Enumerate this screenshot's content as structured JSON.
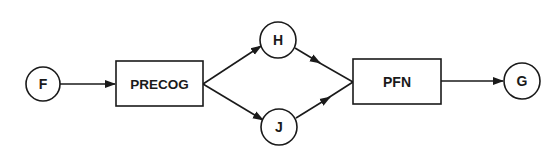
{
  "diagram": {
    "colors": {
      "stroke": "#1a1a1a",
      "background": "#ffffff"
    },
    "nodes": {
      "F": {
        "label": "F",
        "shape": "circle"
      },
      "PRECOG": {
        "label": "PRECOG",
        "shape": "box"
      },
      "H": {
        "label": "H",
        "shape": "circle"
      },
      "J": {
        "label": "J",
        "shape": "circle"
      },
      "PFN": {
        "label": "PFN",
        "shape": "box"
      },
      "G": {
        "label": "G",
        "shape": "circle"
      }
    },
    "edges": [
      {
        "from": "F",
        "to": "PRECOG"
      },
      {
        "from": "PRECOG",
        "to": "H"
      },
      {
        "from": "PRECOG",
        "to": "J"
      },
      {
        "from": "H",
        "to": "PFN"
      },
      {
        "from": "J",
        "to": "PFN"
      },
      {
        "from": "PFN",
        "to": "G"
      }
    ]
  }
}
